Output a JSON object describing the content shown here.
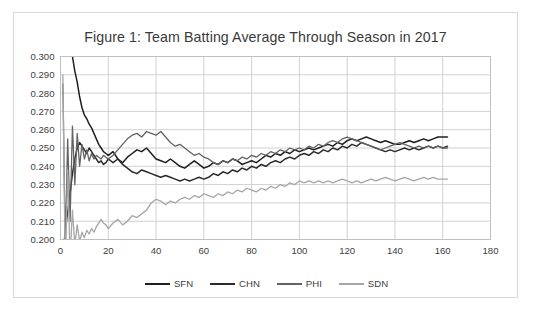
{
  "figure": {
    "title": "Figure 1: Team Batting Average Through Season in 2017"
  },
  "chart_data": {
    "type": "line",
    "title": "Figure 1: Team Batting Average Through Season in 2017",
    "xlabel": "",
    "ylabel": "",
    "xlim": [
      0,
      180
    ],
    "ylim": [
      0.2,
      0.3
    ],
    "xticks": [
      0,
      20,
      40,
      60,
      80,
      100,
      120,
      140,
      160,
      180
    ],
    "yticks": [
      0.2,
      0.21,
      0.22,
      0.23,
      0.24,
      0.25,
      0.26,
      0.27,
      0.28,
      0.29,
      0.3
    ],
    "xtick_labels": [
      "0",
      "20",
      "40",
      "60",
      "80",
      "100",
      "120",
      "140",
      "160",
      "180"
    ],
    "ytick_labels": [
      "0.200",
      "0.210",
      "0.220",
      "0.230",
      "0.240",
      "0.250",
      "0.260",
      "0.270",
      "0.280",
      "0.290",
      "0.300"
    ],
    "grid": true,
    "grid_color": "#d0d0d0",
    "legend_position": "bottom",
    "note": "Cumulative team batting average by game number; lines are clipped at the 0.200-0.300 axis limits during the first few games.",
    "series": [
      {
        "name": "SFN",
        "color": "#1f1f1f",
        "x": [
          1,
          2,
          3,
          4,
          5,
          6,
          7,
          8,
          9,
          10,
          11,
          12,
          13,
          14,
          15,
          16,
          17,
          18,
          19,
          20,
          22,
          24,
          26,
          28,
          30,
          32,
          34,
          36,
          38,
          40,
          42,
          44,
          46,
          48,
          50,
          52,
          54,
          56,
          58,
          60,
          62,
          64,
          66,
          68,
          70,
          72,
          74,
          76,
          78,
          80,
          82,
          84,
          86,
          88,
          90,
          92,
          94,
          96,
          98,
          100,
          102,
          104,
          106,
          108,
          110,
          112,
          114,
          116,
          118,
          120,
          122,
          124,
          126,
          128,
          130,
          132,
          134,
          136,
          138,
          140,
          142,
          144,
          146,
          148,
          150,
          152,
          154,
          156,
          158,
          160,
          162
        ],
        "y": [
          0.345,
          0.33,
          0.318,
          0.31,
          0.3,
          0.292,
          0.286,
          0.278,
          0.272,
          0.268,
          0.266,
          0.263,
          0.261,
          0.258,
          0.255,
          0.252,
          0.25,
          0.248,
          0.247,
          0.246,
          0.248,
          0.244,
          0.242,
          0.245,
          0.247,
          0.249,
          0.248,
          0.25,
          0.247,
          0.244,
          0.243,
          0.242,
          0.244,
          0.242,
          0.24,
          0.239,
          0.241,
          0.243,
          0.241,
          0.239,
          0.24,
          0.242,
          0.241,
          0.243,
          0.242,
          0.244,
          0.243,
          0.241,
          0.242,
          0.243,
          0.242,
          0.244,
          0.246,
          0.245,
          0.247,
          0.246,
          0.248,
          0.247,
          0.249,
          0.248,
          0.249,
          0.25,
          0.249,
          0.25,
          0.251,
          0.252,
          0.251,
          0.253,
          0.252,
          0.254,
          0.255,
          0.254,
          0.255,
          0.256,
          0.255,
          0.254,
          0.253,
          0.254,
          0.253,
          0.252,
          0.252,
          0.253,
          0.254,
          0.253,
          0.254,
          0.255,
          0.254,
          0.255,
          0.256,
          0.256,
          0.256
        ]
      },
      {
        "name": "CHN",
        "color": "#2b2b2b",
        "x": [
          1,
          2,
          3,
          4,
          5,
          6,
          7,
          8,
          9,
          10,
          11,
          12,
          13,
          14,
          15,
          16,
          17,
          18,
          19,
          20,
          22,
          24,
          26,
          28,
          30,
          32,
          34,
          36,
          38,
          40,
          42,
          44,
          46,
          48,
          50,
          52,
          54,
          56,
          58,
          60,
          62,
          64,
          66,
          68,
          70,
          72,
          74,
          76,
          78,
          80,
          82,
          84,
          86,
          88,
          90,
          92,
          94,
          96,
          98,
          100,
          102,
          104,
          106,
          108,
          110,
          112,
          114,
          116,
          118,
          120,
          122,
          124,
          126,
          128,
          130,
          132,
          134,
          136,
          138,
          140,
          142,
          144,
          146,
          148,
          150,
          152,
          154,
          156,
          158,
          160,
          162
        ],
        "y": [
          0.19,
          0.205,
          0.215,
          0.225,
          0.236,
          0.244,
          0.25,
          0.253,
          0.251,
          0.249,
          0.247,
          0.25,
          0.248,
          0.246,
          0.244,
          0.242,
          0.243,
          0.241,
          0.242,
          0.244,
          0.242,
          0.244,
          0.241,
          0.239,
          0.237,
          0.236,
          0.238,
          0.237,
          0.236,
          0.235,
          0.234,
          0.235,
          0.234,
          0.233,
          0.232,
          0.233,
          0.232,
          0.233,
          0.234,
          0.233,
          0.234,
          0.236,
          0.235,
          0.237,
          0.236,
          0.238,
          0.237,
          0.239,
          0.238,
          0.24,
          0.239,
          0.241,
          0.24,
          0.242,
          0.243,
          0.242,
          0.244,
          0.245,
          0.244,
          0.246,
          0.247,
          0.246,
          0.248,
          0.247,
          0.249,
          0.248,
          0.25,
          0.249,
          0.251,
          0.25,
          0.252,
          0.251,
          0.253,
          0.252,
          0.251,
          0.25,
          0.249,
          0.248,
          0.249,
          0.248,
          0.249,
          0.25,
          0.249,
          0.25,
          0.249,
          0.25,
          0.251,
          0.25,
          0.251,
          0.25,
          0.251
        ]
      },
      {
        "name": "PHI",
        "color": "#636363",
        "x": [
          1,
          2,
          3,
          4,
          5,
          6,
          7,
          8,
          9,
          10,
          11,
          12,
          13,
          14,
          15,
          16,
          17,
          18,
          19,
          20,
          22,
          24,
          26,
          28,
          30,
          32,
          34,
          36,
          38,
          40,
          42,
          44,
          46,
          48,
          50,
          52,
          54,
          56,
          58,
          60,
          62,
          64,
          66,
          68,
          70,
          72,
          74,
          76,
          78,
          80,
          82,
          84,
          86,
          88,
          90,
          92,
          94,
          96,
          98,
          100,
          102,
          104,
          106,
          108,
          110,
          112,
          114,
          116,
          118,
          120,
          122,
          124,
          126,
          128,
          130,
          132,
          134,
          136,
          138,
          140,
          142,
          144,
          146,
          148,
          150,
          152,
          154,
          156,
          158,
          160,
          162
        ],
        "y": [
          0.285,
          0.196,
          0.255,
          0.21,
          0.262,
          0.23,
          0.258,
          0.24,
          0.252,
          0.244,
          0.249,
          0.243,
          0.247,
          0.244,
          0.246,
          0.245,
          0.244,
          0.246,
          0.245,
          0.244,
          0.246,
          0.249,
          0.252,
          0.255,
          0.257,
          0.258,
          0.256,
          0.259,
          0.258,
          0.257,
          0.259,
          0.256,
          0.253,
          0.251,
          0.252,
          0.25,
          0.248,
          0.246,
          0.247,
          0.245,
          0.244,
          0.242,
          0.241,
          0.243,
          0.242,
          0.244,
          0.243,
          0.245,
          0.244,
          0.246,
          0.245,
          0.247,
          0.246,
          0.248,
          0.247,
          0.249,
          0.248,
          0.25,
          0.249,
          0.25,
          0.249,
          0.251,
          0.25,
          0.252,
          0.251,
          0.253,
          0.254,
          0.253,
          0.255,
          0.256,
          0.255,
          0.254,
          0.253,
          0.252,
          0.251,
          0.25,
          0.249,
          0.25,
          0.251,
          0.252,
          0.253,
          0.252,
          0.251,
          0.25,
          0.251,
          0.25,
          0.251,
          0.25,
          0.251,
          0.25,
          0.25
        ]
      },
      {
        "name": "SDN",
        "color": "#a6a6a6",
        "x": [
          1,
          2,
          3,
          4,
          5,
          6,
          7,
          8,
          9,
          10,
          11,
          12,
          13,
          14,
          15,
          16,
          17,
          18,
          19,
          20,
          22,
          24,
          26,
          28,
          30,
          32,
          34,
          36,
          38,
          40,
          42,
          44,
          46,
          48,
          50,
          52,
          54,
          56,
          58,
          60,
          62,
          64,
          66,
          68,
          70,
          72,
          74,
          76,
          78,
          80,
          82,
          84,
          86,
          88,
          90,
          92,
          94,
          96,
          98,
          100,
          102,
          104,
          106,
          108,
          110,
          112,
          114,
          116,
          118,
          120,
          122,
          124,
          126,
          128,
          130,
          132,
          134,
          136,
          138,
          140,
          142,
          144,
          146,
          148,
          150,
          152,
          154,
          156,
          158,
          160,
          162
        ],
        "y": [
          0.29,
          0.182,
          0.238,
          0.19,
          0.216,
          0.197,
          0.208,
          0.199,
          0.204,
          0.201,
          0.205,
          0.203,
          0.206,
          0.204,
          0.207,
          0.209,
          0.211,
          0.209,
          0.208,
          0.206,
          0.209,
          0.211,
          0.208,
          0.21,
          0.213,
          0.212,
          0.214,
          0.216,
          0.22,
          0.222,
          0.221,
          0.219,
          0.221,
          0.22,
          0.222,
          0.223,
          0.222,
          0.224,
          0.223,
          0.225,
          0.224,
          0.223,
          0.225,
          0.224,
          0.226,
          0.225,
          0.227,
          0.226,
          0.228,
          0.227,
          0.226,
          0.228,
          0.227,
          0.229,
          0.228,
          0.23,
          0.229,
          0.231,
          0.23,
          0.232,
          0.231,
          0.232,
          0.231,
          0.232,
          0.231,
          0.232,
          0.231,
          0.232,
          0.233,
          0.232,
          0.231,
          0.232,
          0.231,
          0.232,
          0.233,
          0.232,
          0.233,
          0.234,
          0.233,
          0.232,
          0.233,
          0.234,
          0.233,
          0.232,
          0.233,
          0.234,
          0.233,
          0.234,
          0.233,
          0.233,
          0.233
        ]
      }
    ]
  },
  "legend": {
    "items": [
      {
        "label": "SFN",
        "color": "#1f1f1f"
      },
      {
        "label": "CHN",
        "color": "#2b2b2b"
      },
      {
        "label": "PHI",
        "color": "#636363"
      },
      {
        "label": "SDN",
        "color": "#a6a6a6"
      }
    ]
  }
}
